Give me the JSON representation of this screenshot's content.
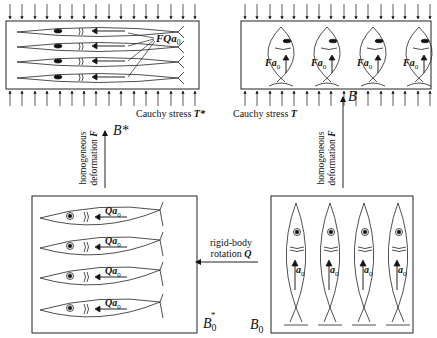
{
  "figure": {
    "top_left_panel": {
      "caption": "Cauchy stress T*",
      "caption_prefix": "Cauchy stress ",
      "caption_symbol": "T*",
      "fish_label": "FQa",
      "fish_label_sub": "0",
      "fish_count": 4,
      "orientation": "horizontal, pointing left, elongated"
    },
    "top_right_panel": {
      "caption_prefix": "Cauchy stress ",
      "caption_symbol": "T",
      "fish_labels": [
        "Fa",
        "Fa",
        "Fa",
        "Fa"
      ],
      "fish_label_sub": "0",
      "fish_count": 4,
      "orientation": "vertical, pointing up, compressed"
    },
    "bottom_left_panel": {
      "configuration_label": "B",
      "configuration_sub": "0",
      "configuration_sup": "*",
      "fish_labels": [
        "Qa",
        "Qa",
        "Qa",
        "Qa"
      ],
      "fish_label_sub": "0",
      "fish_count": 4
    },
    "bottom_right_panel": {
      "configuration_label": "B",
      "configuration_sub": "0",
      "fish_labels": [
        "a",
        "a",
        "a",
        "a"
      ],
      "fish_label_sub": "0",
      "fish_count": 4
    },
    "arrows": {
      "left_vertical": {
        "line1": "homogeneous",
        "line2": "deformation ",
        "symbol": "F",
        "target": "B*"
      },
      "right_vertical": {
        "line1": "homogeneous",
        "line2": "deformation ",
        "symbol": "F",
        "target": "B"
      },
      "horizontal": {
        "line1": "rigid-body",
        "line2": "rotation ",
        "symbol": "Q"
      }
    }
  }
}
